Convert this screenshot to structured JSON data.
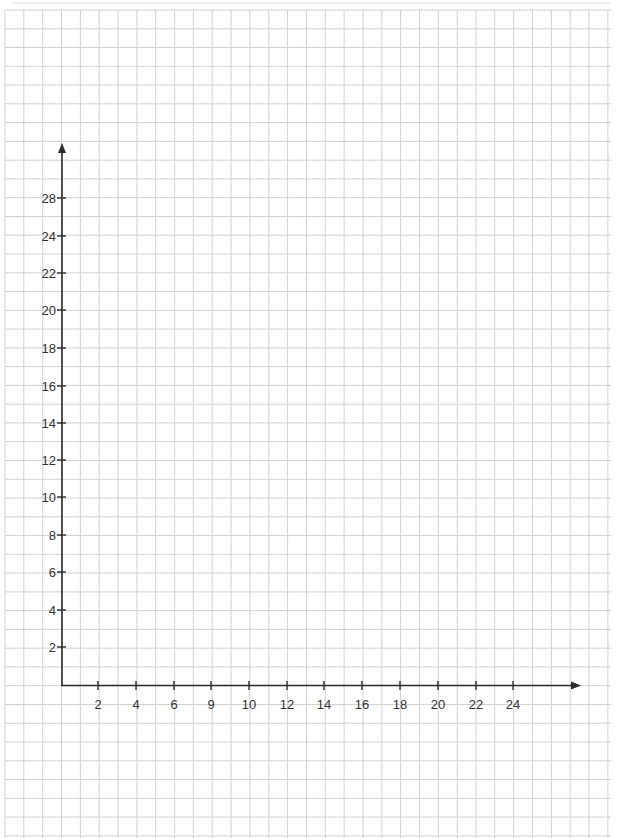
{
  "page": {
    "background": "#ffffff",
    "grid_color": "#d2d2d2",
    "axis_color": "#2b2b2b",
    "text_color": "#333333"
  },
  "chart_data": {
    "type": "line",
    "title": "",
    "xlabel": "",
    "ylabel": "",
    "series": [],
    "grid": true,
    "legend": null,
    "x_tick_labels": [
      "2",
      "4",
      "6",
      "9",
      "10",
      "12",
      "14",
      "16",
      "18",
      "20",
      "22",
      "24"
    ],
    "y_tick_labels": [
      "2",
      "4",
      "6",
      "8",
      "10",
      "12",
      "14",
      "16",
      "18",
      "20",
      "22",
      "24",
      "28"
    ],
    "xlim": [
      0,
      28
    ],
    "ylim": [
      0,
      30
    ]
  },
  "axes": {
    "x_ticks": [
      {
        "label": "2",
        "x": 98
      },
      {
        "label": "4",
        "x": 136
      },
      {
        "label": "6",
        "x": 174
      },
      {
        "label": "9",
        "x": 211
      },
      {
        "label": "10",
        "x": 249
      },
      {
        "label": "12",
        "x": 287
      },
      {
        "label": "14",
        "x": 324
      },
      {
        "label": "16",
        "x": 362
      },
      {
        "label": "18",
        "x": 400
      },
      {
        "label": "20",
        "x": 438
      },
      {
        "label": "22",
        "x": 476
      },
      {
        "label": "24",
        "x": 513
      }
    ],
    "y_ticks": [
      {
        "label": "28",
        "y": 198
      },
      {
        "label": "24",
        "y": 236
      },
      {
        "label": "22",
        "y": 273
      },
      {
        "label": "20",
        "y": 310
      },
      {
        "label": "18",
        "y": 348
      },
      {
        "label": "16",
        "y": 386
      },
      {
        "label": "14",
        "y": 423
      },
      {
        "label": "12",
        "y": 460
      },
      {
        "label": "10",
        "y": 497
      },
      {
        "label": "8",
        "y": 535
      },
      {
        "label": "6",
        "y": 572
      },
      {
        "label": "4",
        "y": 610
      },
      {
        "label": "2",
        "y": 647
      }
    ]
  }
}
